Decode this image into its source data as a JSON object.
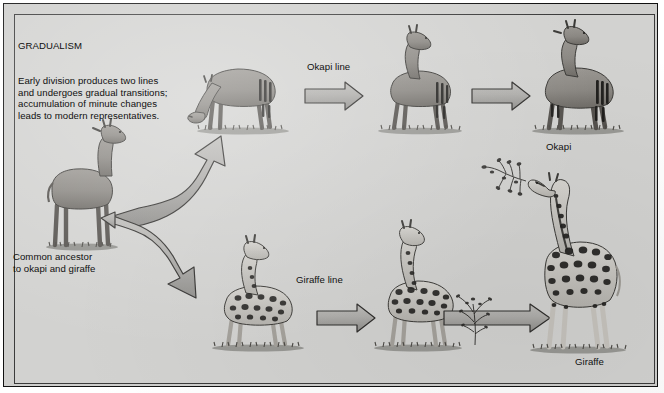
{
  "figure": {
    "heading": "GRADUALISM",
    "description_lines": [
      "Early division produces two lines",
      "and undergoes gradual transitions;",
      "accumulation of minute changes",
      "leads to modern representatives."
    ],
    "description": "Early division produces two lines\nand undergoes gradual transitions;\naccumulation of minute changes\nleads to modern representatives.",
    "background_color": "#d2d2d0",
    "frame_color": "#111111",
    "ink_color": "#101010"
  },
  "labels": {
    "ancestor": "Common ancestor\nto okapi and giraffe",
    "okapi_line": "Okapi line",
    "okapi": "Okapi",
    "giraffe_line": "Giraffe line",
    "giraffe": "Giraffe"
  },
  "branches": [
    {
      "name": "okapi-line",
      "label": "Okapi line",
      "terminal_label": "Okapi",
      "stages": [
        "grazing-proto-okapi",
        "intermediate-okapi",
        "modern-okapi"
      ],
      "arrow_count": 2
    },
    {
      "name": "giraffe-line",
      "label": "Giraffe line",
      "terminal_label": "Giraffe",
      "stages": [
        "spotted-proto-giraffe",
        "intermediate-giraffe",
        "modern-giraffe"
      ],
      "arrow_count": 2
    }
  ],
  "ancestor": {
    "name": "common-ancestor",
    "label": "Common ancestor\nto okapi and giraffe"
  },
  "icons": {
    "fork_arrow": "forked-arrow-icon",
    "right_arrow": "right-arrow-icon",
    "shrub": "shrub-icon",
    "branch": "leafy-branch-icon"
  },
  "colors": {
    "paper": "#d2d2d0",
    "arrow": "#a9a8a4",
    "animal": "#8d8a85",
    "outline": "#3a3936",
    "spot": "#232220"
  }
}
